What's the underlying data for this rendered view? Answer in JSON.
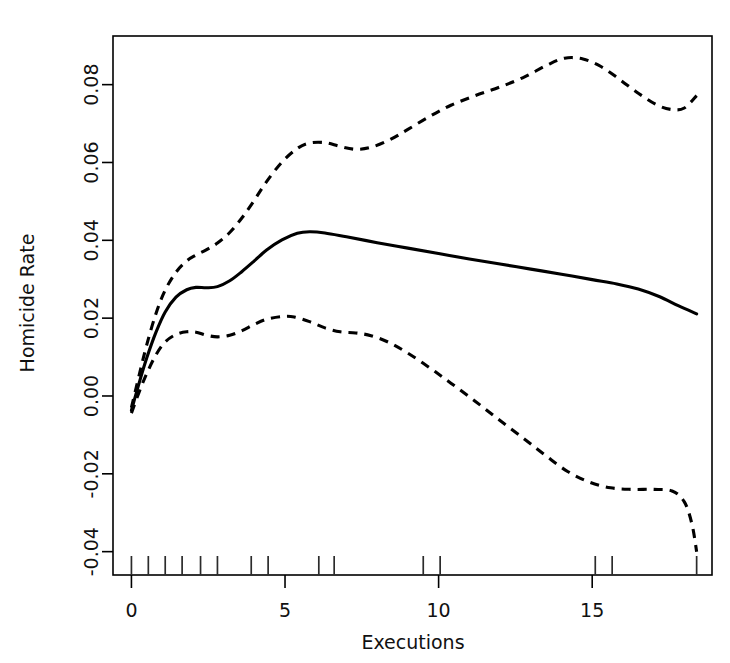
{
  "chart_data": {
    "type": "line",
    "title": "",
    "xlabel": "Executions",
    "ylabel": "Homicide Rate",
    "xlim": [
      -0.6,
      18.9
    ],
    "ylim": [
      -0.046,
      0.0925
    ],
    "grid": false,
    "legend": "none",
    "xticks": [
      0,
      5,
      10,
      15
    ],
    "xticklabels": [
      "0",
      "5",
      "10",
      "15"
    ],
    "yticks": [
      -0.04,
      -0.02,
      0.0,
      0.02,
      0.04,
      0.06,
      0.08
    ],
    "yticklabels": [
      "-0.04",
      "-0.02",
      "0.00",
      "0.02",
      "0.04",
      "0.06",
      "0.08"
    ],
    "rug_x": [
      0.0,
      0.55,
      1.1,
      1.65,
      2.25,
      2.8,
      3.9,
      4.45,
      6.1,
      6.6,
      9.5,
      10.05,
      15.1,
      15.65,
      18.4
    ],
    "series": [
      {
        "name": "fitted",
        "style": "solid",
        "points": [
          [
            0.0,
            -0.0037
          ],
          [
            0.25,
            0.0033
          ],
          [
            0.5,
            0.0098
          ],
          [
            0.8,
            0.0164
          ],
          [
            1.1,
            0.0216
          ],
          [
            1.45,
            0.0254
          ],
          [
            1.8,
            0.0273
          ],
          [
            2.1,
            0.0279
          ],
          [
            2.45,
            0.0278
          ],
          [
            2.8,
            0.0281
          ],
          [
            3.2,
            0.0296
          ],
          [
            3.6,
            0.032
          ],
          [
            4.0,
            0.0347
          ],
          [
            4.4,
            0.0375
          ],
          [
            4.9,
            0.0401
          ],
          [
            5.4,
            0.0418
          ],
          [
            5.8,
            0.0422
          ],
          [
            6.3,
            0.0419
          ],
          [
            7.0,
            0.0409
          ],
          [
            8.0,
            0.0394
          ],
          [
            9.0,
            0.038
          ],
          [
            10.0,
            0.0366
          ],
          [
            11.0,
            0.0352
          ],
          [
            12.0,
            0.0339
          ],
          [
            13.0,
            0.0326
          ],
          [
            14.0,
            0.0313
          ],
          [
            15.0,
            0.0299
          ],
          [
            15.8,
            0.0288
          ],
          [
            16.5,
            0.0275
          ],
          [
            17.2,
            0.0255
          ],
          [
            17.8,
            0.0232
          ],
          [
            18.4,
            0.0211
          ]
        ]
      },
      {
        "name": "upper-confidence",
        "style": "dashed",
        "points": [
          [
            0.0,
            -0.003
          ],
          [
            0.25,
            0.0053
          ],
          [
            0.5,
            0.0132
          ],
          [
            0.8,
            0.0212
          ],
          [
            1.1,
            0.0272
          ],
          [
            1.45,
            0.0318
          ],
          [
            1.8,
            0.0347
          ],
          [
            2.1,
            0.0362
          ],
          [
            2.45,
            0.0376
          ],
          [
            2.8,
            0.0393
          ],
          [
            3.2,
            0.042
          ],
          [
            3.6,
            0.0458
          ],
          [
            4.0,
            0.0503
          ],
          [
            4.4,
            0.0551
          ],
          [
            4.9,
            0.0601
          ],
          [
            5.4,
            0.0636
          ],
          [
            5.8,
            0.065
          ],
          [
            6.3,
            0.0651
          ],
          [
            6.8,
            0.0641
          ],
          [
            7.3,
            0.0634
          ],
          [
            7.8,
            0.0639
          ],
          [
            8.4,
            0.0658
          ],
          [
            9.0,
            0.0685
          ],
          [
            9.7,
            0.0718
          ],
          [
            10.4,
            0.0747
          ],
          [
            11.2,
            0.0772
          ],
          [
            12.0,
            0.0794
          ],
          [
            12.8,
            0.082
          ],
          [
            13.5,
            0.0849
          ],
          [
            14.1,
            0.0868
          ],
          [
            14.7,
            0.0866
          ],
          [
            15.3,
            0.0846
          ],
          [
            15.9,
            0.0813
          ],
          [
            16.5,
            0.0778
          ],
          [
            17.1,
            0.0748
          ],
          [
            17.6,
            0.0736
          ],
          [
            18.0,
            0.074
          ],
          [
            18.4,
            0.0772
          ]
        ]
      },
      {
        "name": "lower-confidence",
        "style": "dashed",
        "points": [
          [
            0.0,
            -0.0044
          ],
          [
            0.25,
            0.001
          ],
          [
            0.5,
            0.0058
          ],
          [
            0.8,
            0.0106
          ],
          [
            1.1,
            0.0139
          ],
          [
            1.45,
            0.0158
          ],
          [
            1.8,
            0.0165
          ],
          [
            2.1,
            0.0164
          ],
          [
            2.45,
            0.0156
          ],
          [
            2.8,
            0.0152
          ],
          [
            3.2,
            0.0156
          ],
          [
            3.6,
            0.0168
          ],
          [
            4.0,
            0.0184
          ],
          [
            4.4,
            0.0197
          ],
          [
            4.9,
            0.0204
          ],
          [
            5.3,
            0.0203
          ],
          [
            5.8,
            0.0191
          ],
          [
            6.3,
            0.0175
          ],
          [
            6.8,
            0.0165
          ],
          [
            7.3,
            0.0162
          ],
          [
            7.8,
            0.0155
          ],
          [
            8.4,
            0.0137
          ],
          [
            9.0,
            0.011
          ],
          [
            9.7,
            0.0073
          ],
          [
            10.4,
            0.0033
          ],
          [
            11.2,
            -0.0014
          ],
          [
            12.0,
            -0.0063
          ],
          [
            12.8,
            -0.0111
          ],
          [
            13.5,
            -0.0154
          ],
          [
            14.2,
            -0.0194
          ],
          [
            14.9,
            -0.0221
          ],
          [
            15.6,
            -0.0236
          ],
          [
            16.3,
            -0.024
          ],
          [
            17.0,
            -0.024
          ],
          [
            17.6,
            -0.0244
          ],
          [
            18.0,
            -0.0272
          ],
          [
            18.25,
            -0.033
          ],
          [
            18.4,
            -0.04
          ]
        ]
      }
    ]
  }
}
